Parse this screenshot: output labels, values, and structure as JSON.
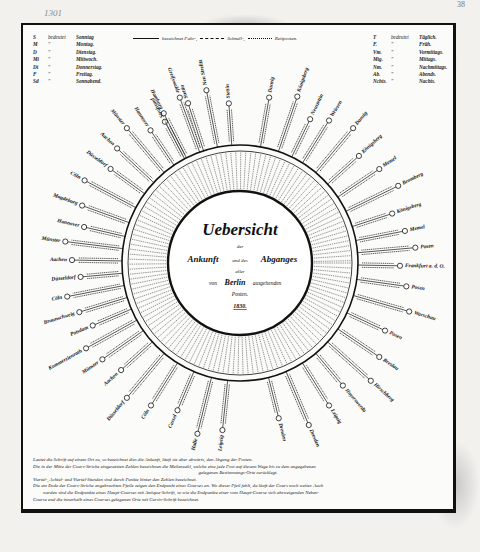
{
  "page": {
    "margin_note": "1301",
    "page_number": "38"
  },
  "legend_days": {
    "header": {
      "abbr": "S",
      "means": "bedeutet",
      "value": "Sonntag"
    },
    "rows": [
      {
        "abbr": "M",
        "means": "\"",
        "value": "Montag."
      },
      {
        "abbr": "D",
        "means": "\"",
        "value": "Dienstag."
      },
      {
        "abbr": "Mi",
        "means": "\"",
        "value": "Mittwoch."
      },
      {
        "abbr": "Dt",
        "means": "\"",
        "value": "Donnerstag."
      },
      {
        "abbr": "F",
        "means": "\"",
        "value": "Freitag."
      },
      {
        "abbr": "Sd",
        "means": "\"",
        "value": "Sonnabend."
      }
    ]
  },
  "legend_times": {
    "header": {
      "abbr": "T",
      "means": "bedeutet",
      "value": "Täglich."
    },
    "rows": [
      {
        "abbr": "F.",
        "means": "\"",
        "value": "Früh."
      },
      {
        "abbr": "Vm.",
        "means": "\"",
        "value": "Vormittags."
      },
      {
        "abbr": "Mtg.",
        "means": "\"",
        "value": "Mittags."
      },
      {
        "abbr": "Nm.",
        "means": "\"",
        "value": "Nachmittags."
      },
      {
        "abbr": "Ab.",
        "means": "\"",
        "value": "Abends."
      },
      {
        "abbr": "Nchts.",
        "means": "\"",
        "value": "Nachts."
      }
    ]
  },
  "line_key": {
    "solid_label": "bezeichnet Fahr-,",
    "dashed_label": "Schnell-,",
    "dashdot_label": "Reitposten."
  },
  "center": {
    "title": "Uebersicht",
    "line1_small": "der",
    "line2_left": "Ankunft",
    "line2_mid": "und des",
    "line2_right": "Abganges",
    "line3_small": "aller",
    "line4_left": "von",
    "line4_city": "Berlin",
    "line4_right": "ausgehenden",
    "line5": "Posten.",
    "year": "1830."
  },
  "destinations": [
    {
      "name": "Stralsund",
      "angle": -118
    },
    {
      "name": "Stettin",
      "angle": -108
    },
    {
      "name": "Neu Strelitz",
      "angle": -101
    },
    {
      "name": "Stettin",
      "angle": -94
    },
    {
      "name": "Danzig",
      "angle": -80
    },
    {
      "name": "Königsberg",
      "angle": -71
    },
    {
      "name": "Neustettin",
      "angle": -64
    },
    {
      "name": "Wriezen",
      "angle": -58
    },
    {
      "name": "Danzig",
      "angle": -50
    },
    {
      "name": "Königsberg",
      "angle": -42
    },
    {
      "name": "Memel",
      "angle": -34
    },
    {
      "name": "Bromberg",
      "angle": -26
    },
    {
      "name": "Königsberg",
      "angle": -18
    },
    {
      "name": "Memel",
      "angle": -11
    },
    {
      "name": "Posen",
      "angle": -5
    },
    {
      "name": "Frankfurt a. d. O.",
      "angle": 1
    },
    {
      "name": "Posen",
      "angle": 8
    },
    {
      "name": "Warschau",
      "angle": 16
    },
    {
      "name": "Posen",
      "angle": 25
    },
    {
      "name": "Breslau",
      "angle": 34
    },
    {
      "name": "Hirschberg",
      "angle": 42
    },
    {
      "name": "Hoyerswerda",
      "angle": 50
    },
    {
      "name": "Leipzig",
      "angle": 58
    },
    {
      "name": "Dresden",
      "angle": 67
    },
    {
      "name": "Dresden",
      "angle": 76
    },
    {
      "name": "Leipzig",
      "angle": 96
    },
    {
      "name": "Halle",
      "angle": 104
    },
    {
      "name": "Cassel",
      "angle": 113
    },
    {
      "name": "Cöln",
      "angle": 122
    },
    {
      "name": "Düsseldorf",
      "angle": 130
    },
    {
      "name": "Aachen",
      "angle": 138
    },
    {
      "name": "Münster",
      "angle": 145
    },
    {
      "name": "Kommerzienrath",
      "angle": 151
    },
    {
      "name": "Potsdam",
      "angle": 157
    },
    {
      "name": "Braunschweig",
      "angle": 163
    },
    {
      "name": "Cöln",
      "angle": 169
    },
    {
      "name": "Düsseldorf",
      "angle": 175
    },
    {
      "name": "Aachen",
      "angle": 181
    },
    {
      "name": "Münster",
      "angle": 187
    },
    {
      "name": "Hannover",
      "angle": 193
    },
    {
      "name": "Magdeburg",
      "angle": 200
    },
    {
      "name": "Cöln",
      "angle": 208
    },
    {
      "name": "Düsseldorf",
      "angle": 216
    },
    {
      "name": "Aachen",
      "angle": 223
    },
    {
      "name": "Münster",
      "angle": 230
    },
    {
      "name": "Hannover",
      "angle": 236
    },
    {
      "name": "Hamburg",
      "angle": 243
    },
    {
      "name": "Greifswalde",
      "angle": 250
    }
  ],
  "notes": {
    "line1": "Lautet die Schrift auf einem Ort zu, so bezeichnet dies die Ankunft, läuft sie aber abwärts, den Abgang der Posten.",
    "line2": "Die in der Mitte der Cours-Striche eingesetzten Zahlen bezeichnen die Meilenzahl, welche eine jede Post auf diesem Wege bis zu dem angegebenen",
    "line3": "gelegenen Bestimmungs-Orte zurücklegt.",
    "line4": "Viertel-, Achtel- und Viertel-Stunden sind durch Punkte hinter den Zahlen bezeichnet.",
    "line5": "Die am Ende der Cours-Striche angebrachten Pfeile zeigen den Endpunkt eines Courses an. Wo dieser Pfeil fehlt, da läuft der Cours noch weiter. Auch",
    "line6": "werden sind die Endpunkte eines Haupt-Courses mit Antiqua-Schrift, so wie die Endpunkte einer vom Haupt-Course sich abzweigenden Neben-",
    "line7": "Course und die innerhalb eines Courses gelegenen Orte mit Cursiv-Schrift bezeichnet."
  },
  "colors": {
    "paper": "#fbfbfa",
    "ink": "#111111",
    "background": "#f2f1ee"
  }
}
